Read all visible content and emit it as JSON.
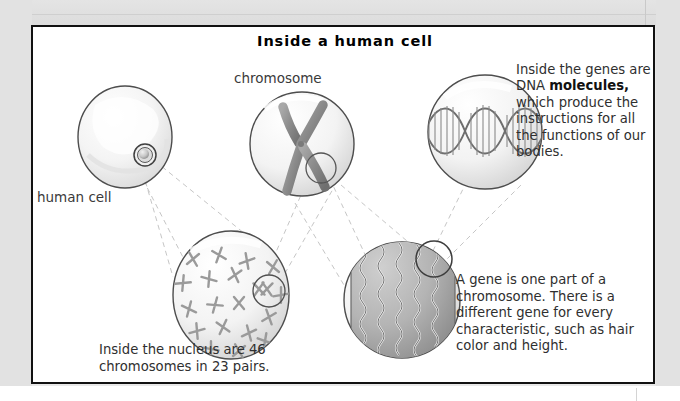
{
  "figure": {
    "title": "Inside a human cell",
    "labels": {
      "chromosome": "chromosome",
      "human_cell": "human cell"
    },
    "captions": {
      "dna_molecules_line1": "Inside the",
      "dna_molecules_line2": "genes are DNA",
      "dna_molecules_bold": "molecules,",
      "dna_molecules_after_bold": " which",
      "dna_molecules_line4": "produce the",
      "dna_molecules_line5": "instructions for",
      "dna_molecules_line6": "all the functions",
      "dna_molecules_line7": "of our bodies.",
      "gene_definition": "A gene is one part of a chromosome. There is a different gene for every characteristic, such as hair color and height.",
      "nucleus_caption": "Inside the nucleus are 46 chromosomes in 23 pairs."
    },
    "diagram_elements": {
      "human_cell_circle": "human-cell-illustration",
      "chromosome_circle": "chromosome-illustration",
      "dna_helix_circle": "dna-double-helix-illustration",
      "nucleus_circle": "nucleus-with-chromosomes-illustration",
      "coiled_dna_circle": "coiled-dna-chromosome-illustration",
      "connector_style": "dashed-gray-leader-lines"
    },
    "colors": {
      "panel_border": "#111111",
      "page_background": "#e8e8e8",
      "panel_background": "#ffffff",
      "text": "#2f2f2f",
      "illustration_outline": "#4a4a4a",
      "illustration_fill_light": "#f2f2f2",
      "illustration_fill_mid": "#9a9a9a",
      "illustration_fill_dark": "#7d7d7d",
      "leader_line": "#c8c8c8"
    }
  }
}
